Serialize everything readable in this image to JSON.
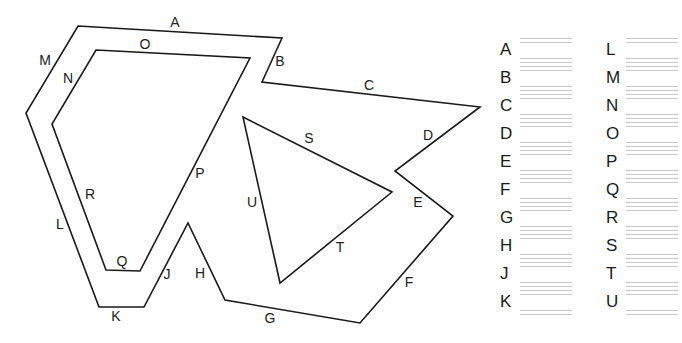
{
  "diagram": {
    "shapes": [
      {
        "name": "outer-polygon",
        "points": "78,26 282,38 262,82 480,107 395,171 453,216 360,323 225,300 188,223 144,307 99,307 26,113"
      },
      {
        "name": "inner-quadrilateral",
        "points": "96,50 250,58 140,271 106,270 52,124"
      },
      {
        "name": "triangle",
        "points": "243,117 392,192 280,283"
      }
    ],
    "edge_labels": [
      {
        "id": "A",
        "x": 175,
        "y": 27
      },
      {
        "id": "B",
        "x": 280,
        "y": 66
      },
      {
        "id": "C",
        "x": 369,
        "y": 90
      },
      {
        "id": "D",
        "x": 428,
        "y": 140
      },
      {
        "id": "E",
        "x": 418,
        "y": 207
      },
      {
        "id": "F",
        "x": 409,
        "y": 287
      },
      {
        "id": "G",
        "x": 270,
        "y": 323
      },
      {
        "id": "H",
        "x": 200,
        "y": 278
      },
      {
        "id": "J",
        "x": 167,
        "y": 279
      },
      {
        "id": "K",
        "x": 116,
        "y": 321
      },
      {
        "id": "L",
        "x": 60,
        "y": 229
      },
      {
        "id": "M",
        "x": 45,
        "y": 65
      },
      {
        "id": "N",
        "x": 68,
        "y": 83
      },
      {
        "id": "O",
        "x": 145,
        "y": 49
      },
      {
        "id": "P",
        "x": 200,
        "y": 178
      },
      {
        "id": "Q",
        "x": 122,
        "y": 266
      },
      {
        "id": "R",
        "x": 90,
        "y": 199
      },
      {
        "id": "S",
        "x": 309,
        "y": 143
      },
      {
        "id": "T",
        "x": 340,
        "y": 252
      },
      {
        "id": "U",
        "x": 252,
        "y": 207
      }
    ]
  },
  "answer_sheet": {
    "left_column": [
      {
        "label": "A",
        "value": ""
      },
      {
        "label": "B",
        "value": ""
      },
      {
        "label": "C",
        "value": ""
      },
      {
        "label": "D",
        "value": ""
      },
      {
        "label": "E",
        "value": ""
      },
      {
        "label": "F",
        "value": ""
      },
      {
        "label": "G",
        "value": ""
      },
      {
        "label": "H",
        "value": ""
      },
      {
        "label": "J",
        "value": ""
      },
      {
        "label": "K",
        "value": ""
      }
    ],
    "right_column": [
      {
        "label": "L",
        "value": ""
      },
      {
        "label": "M",
        "value": ""
      },
      {
        "label": "N",
        "value": ""
      },
      {
        "label": "O",
        "value": ""
      },
      {
        "label": "P",
        "value": ""
      },
      {
        "label": "Q",
        "value": ""
      },
      {
        "label": "R",
        "value": ""
      },
      {
        "label": "S",
        "value": ""
      },
      {
        "label": "T",
        "value": ""
      },
      {
        "label": "U",
        "value": ""
      }
    ]
  },
  "colors": {
    "stroke": "#1a1a1a",
    "text": "#222222",
    "writing_lines": "#c8c8c8",
    "background": "#ffffff"
  }
}
